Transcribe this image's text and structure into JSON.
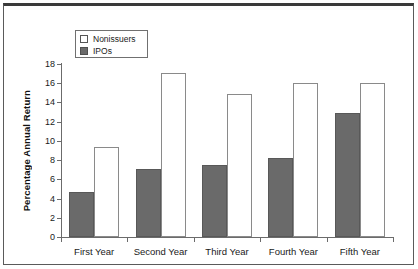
{
  "chart_data": {
    "type": "bar",
    "title": "",
    "subtitle": "",
    "xlabel": "",
    "ylabel": "Percentage Annual Return",
    "categories": [
      "First Year",
      "Second Year",
      "Third Year",
      "Fourth Year",
      "Fifth Year"
    ],
    "series": [
      {
        "name": "Nonissuers",
        "values": [
          9.4,
          17.1,
          14.9,
          16.0,
          16.0
        ],
        "color": "#ffffff",
        "edge_color": "#8a8a8a"
      },
      {
        "name": "IPOs",
        "values": [
          4.7,
          7.1,
          7.5,
          8.2,
          12.9
        ],
        "color": "#6a6a6a",
        "edge_color": "#585858"
      }
    ],
    "ylim": [
      0,
      18
    ],
    "ytick_values": [
      0,
      2,
      4,
      6,
      8,
      10,
      12,
      14,
      16,
      18
    ],
    "ytick_labels": [
      "0",
      "2",
      "4",
      "6",
      "8",
      "10",
      "12",
      "14",
      "16",
      "18"
    ],
    "grid": false,
    "legend_position": "upper-left-inside",
    "bar_order": [
      "IPOs",
      "Nonissuers"
    ]
  },
  "legend": {
    "entries": [
      {
        "label": "Nonissuers",
        "swatch": "open-square-swatch"
      },
      {
        "label": "IPOs",
        "swatch": "filled-square-swatch"
      }
    ]
  },
  "colors": {
    "ipo_fill": "#6a6a6a",
    "nonissuer_fill": "#ffffff",
    "axis": "#6b6b6b",
    "frame": "#5a5a5a",
    "text": "#1a1a1a"
  }
}
